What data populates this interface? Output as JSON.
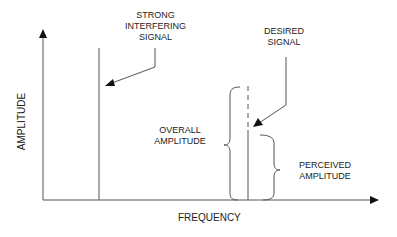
{
  "diagram": {
    "axes": {
      "y_label": "AMPLITUDE",
      "x_label": "FREQUENCY"
    },
    "labels": {
      "strong_line1": "STRONG",
      "strong_line2": "INTERFERING",
      "strong_line3": "SIGNAL",
      "desired_line1": "DESIRED",
      "desired_line2": "SIGNAL",
      "overall_line1": "OVERALL",
      "overall_line2": "AMPLITUDE",
      "perceived_line1": "PERCEIVED",
      "perceived_line2": "AMPLITUDE"
    },
    "colors": {
      "line": "#555555",
      "arrow": "#111111",
      "text": "#222222"
    }
  }
}
